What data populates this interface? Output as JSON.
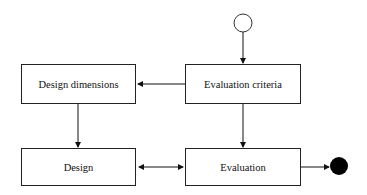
{
  "diagram": {
    "type": "activity-flow",
    "nodes": {
      "start": {
        "kind": "initial-state"
      },
      "evaluation_criteria": {
        "label": "Evaluation criteria"
      },
      "design_dimensions": {
        "label": "Design dimensions"
      },
      "design": {
        "label": "Design"
      },
      "evaluation": {
        "label": "Evaluation"
      },
      "end": {
        "kind": "final-state"
      }
    },
    "edges": [
      {
        "from": "start",
        "to": "evaluation_criteria"
      },
      {
        "from": "evaluation_criteria",
        "to": "design_dimensions"
      },
      {
        "from": "evaluation_criteria",
        "to": "evaluation"
      },
      {
        "from": "design_dimensions",
        "to": "design"
      },
      {
        "from": "design",
        "to": "evaluation",
        "bidirectional": true
      },
      {
        "from": "evaluation",
        "to": "end"
      }
    ]
  }
}
